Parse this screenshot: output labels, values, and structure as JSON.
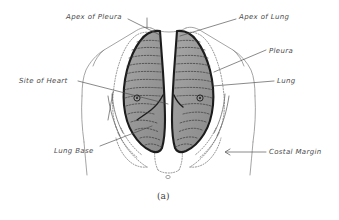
{
  "figure": {
    "caption": "(a)",
    "background_color": "#ffffff",
    "ink_color": "#4a4a4a",
    "lung_fill_color": "#9a9a9a",
    "lung_outline_color": "#1c1c1c",
    "body_outline_color": "#8d8d8d",
    "pleura_dotted_color": "#6f6f6f"
  },
  "labels": [
    {
      "id": "apex-of-pleura",
      "text": "Apex of Pleura",
      "x": 66,
      "y": 14
    },
    {
      "id": "apex-of-lung",
      "text": "Apex of Lung",
      "x": 239,
      "y": 14
    },
    {
      "id": "pleura",
      "text": "Pleura",
      "x": 269,
      "y": 48
    },
    {
      "id": "site-of-heart",
      "text": "Site of Heart",
      "x": 19,
      "y": 78
    },
    {
      "id": "lung",
      "text": "Lung",
      "x": 277,
      "y": 78
    },
    {
      "id": "lung-base",
      "text": "Lung Base",
      "x": 54,
      "y": 148
    },
    {
      "id": "costal-margin",
      "text": "Costal Margin",
      "x": 269,
      "y": 149
    }
  ],
  "caption_position": {
    "x": 157,
    "y": 192
  }
}
